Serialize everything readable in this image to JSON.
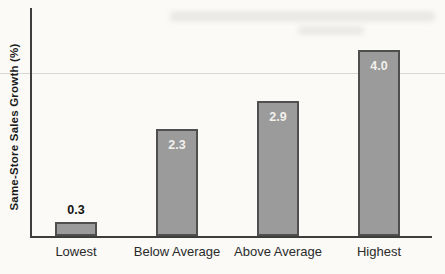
{
  "figure": {
    "background_color": "#fbfaf7",
    "axis_color": "#3d3d3d",
    "bar_fill_color": "#9b9b9b",
    "bar_border_color": "#4f4f4f",
    "value_label_inside_color": "#f2f1ec",
    "value_label_outside_color": "#121212"
  },
  "chart_data": {
    "type": "bar",
    "title": "",
    "xlabel": "",
    "ylabel": "Same-Store Sales Growth (%)",
    "categories": [
      "Lowest",
      "Below Average",
      "Above Average",
      "Highest"
    ],
    "values": [
      0.3,
      2.3,
      2.9,
      4.0
    ],
    "value_labels": [
      "0.3",
      "2.3",
      "2.9",
      "4.0"
    ],
    "ylim": [
      0,
      5
    ],
    "grid": false,
    "legend": null,
    "bar_label_placement": [
      "above",
      "inside",
      "inside",
      "inside"
    ]
  }
}
